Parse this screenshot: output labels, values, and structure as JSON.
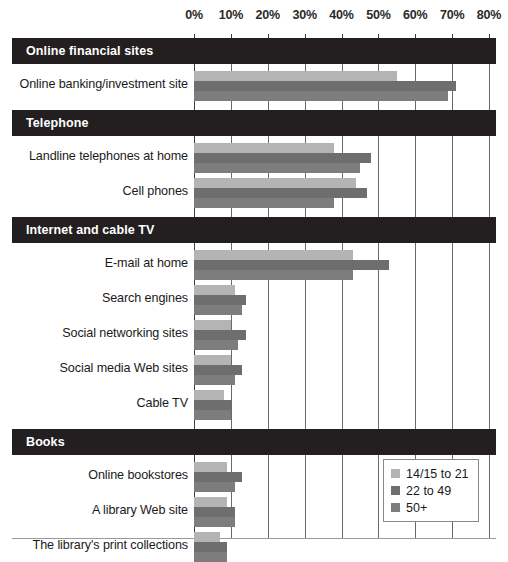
{
  "chart_data": {
    "type": "bar",
    "orientation": "horizontal",
    "title": "",
    "xlabel": "",
    "ylabel": "",
    "xlim": [
      0,
      80
    ],
    "grid": true,
    "legend_position": "bottom-right",
    "xticks": [
      "0%",
      "10%",
      "20%",
      "30%",
      "40%",
      "50%",
      "60%",
      "70%",
      "80%"
    ],
    "xtick_values": [
      0,
      10,
      20,
      30,
      40,
      50,
      60,
      70,
      80
    ],
    "series": [
      {
        "name": "14/15 to 21",
        "color": "#b4b4b4"
      },
      {
        "name": "22 to 49",
        "color": "#6e6e6e"
      },
      {
        "name": "50+",
        "color": "#7d7d7d"
      }
    ],
    "sections": [
      {
        "header": "Online financial sites",
        "categories": [
          {
            "label": "Online banking/investment site",
            "values": [
              55,
              71,
              69
            ]
          }
        ]
      },
      {
        "header": "Telephone",
        "categories": [
          {
            "label": "Landline telephones at home",
            "values": [
              38,
              48,
              45
            ]
          },
          {
            "label": "Cell phones",
            "values": [
              44,
              47,
              38
            ]
          }
        ]
      },
      {
        "header": "Internet and cable TV",
        "categories": [
          {
            "label": "E-mail at home",
            "values": [
              43,
              53,
              43
            ]
          },
          {
            "label": "Search engines",
            "values": [
              11,
              14,
              13
            ]
          },
          {
            "label": "Social networking sites",
            "values": [
              10,
              14,
              12
            ]
          },
          {
            "label": "Social media Web sites",
            "values": [
              10,
              13,
              11
            ]
          },
          {
            "label": "Cable TV",
            "values": [
              8,
              10,
              10
            ]
          }
        ]
      },
      {
        "header": "Books",
        "categories": [
          {
            "label": "Online bookstores",
            "values": [
              9,
              13,
              11
            ]
          },
          {
            "label": "A library Web site",
            "values": [
              9,
              11,
              11
            ]
          },
          {
            "label": "The library's print collections",
            "values": [
              7,
              9,
              9
            ]
          }
        ]
      }
    ]
  },
  "legend": {
    "items": [
      {
        "label": "14/15 to 21",
        "color": "#b4b4b4"
      },
      {
        "label": "22 to 49",
        "color": "#6e6e6e"
      },
      {
        "label": "50+",
        "color": "#7d7d7d"
      }
    ]
  }
}
